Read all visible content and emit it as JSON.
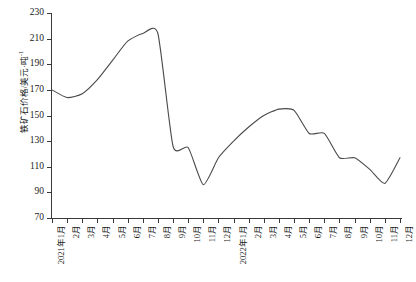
{
  "chart_data": {
    "type": "line",
    "title": "",
    "xlabel": "",
    "ylabel": "铁矿石价格/美元·吨-1",
    "ylabel_main": "铁矿石价格/美元·吨",
    "ylabel_sup": "-1",
    "ylim": [
      70,
      230
    ],
    "ytick_step": 20,
    "yticks": [
      230,
      210,
      190,
      170,
      150,
      130,
      110,
      90,
      70
    ],
    "grid": false,
    "legend": null,
    "categories": [
      "2021年1月",
      "2月",
      "3月",
      "4月",
      "5月",
      "6月",
      "7月",
      "8月",
      "9月",
      "10月",
      "11月",
      "12月",
      "2022年1月",
      "2月",
      "3月",
      "4月",
      "5月",
      "6月",
      "7月",
      "8月",
      "9月",
      "10月",
      "11月",
      "12月"
    ],
    "series": [
      {
        "name": "铁矿石价格",
        "values": [
          170,
          164,
          167,
          178,
          193,
          208,
          214,
          214,
          126,
          125,
          96,
          117,
          130,
          141,
          150,
          155,
          154,
          136,
          136,
          117,
          117,
          108,
          97,
          117
        ]
      }
    ],
    "annotations": []
  }
}
